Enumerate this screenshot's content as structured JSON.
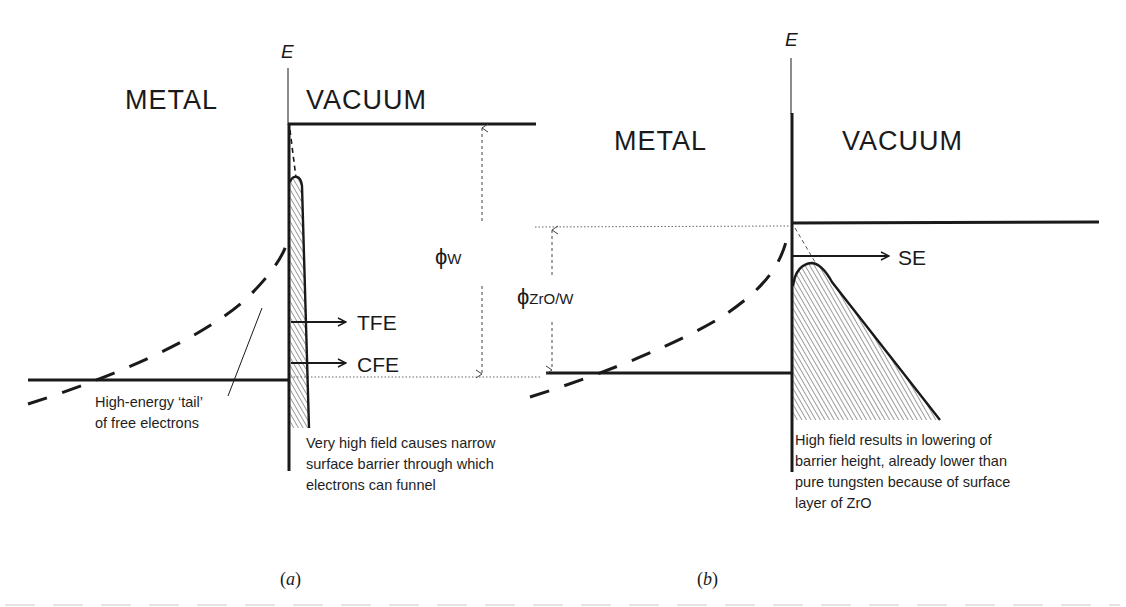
{
  "figure": {
    "type": "energy-band diagram",
    "panels": [
      {
        "id": "a",
        "tag": "(a)",
        "tag_letter": "a",
        "axis_label": "E",
        "left_region": "METAL",
        "right_region": "VACUUM",
        "work_function_label": "ϕ",
        "work_function_sub": "W",
        "emission_labels": [
          "TFE",
          "CFE"
        ],
        "annotations": {
          "tail": [
            "High-energy ‘tail’",
            "of free electrons"
          ],
          "barrier": "Very high field causes narrow surface barrier through which electrons can funnel"
        }
      },
      {
        "id": "b",
        "tag": "(b)",
        "tag_letter": "b",
        "axis_label": "E",
        "left_region": "METAL",
        "right_region": "VACUUM",
        "work_function_label": "ϕ",
        "work_function_sub": "ZrO/W",
        "emission_labels": [
          "SE"
        ],
        "annotations": {
          "barrier": "High field results in lowering of barrier height, already lower than pure tungsten because of surface layer of ZrO"
        }
      }
    ],
    "colors": {
      "ink": "#1a1a1a",
      "background": "#ffffff",
      "hatch": "#3a3a3a",
      "dotted": "#555555"
    }
  }
}
